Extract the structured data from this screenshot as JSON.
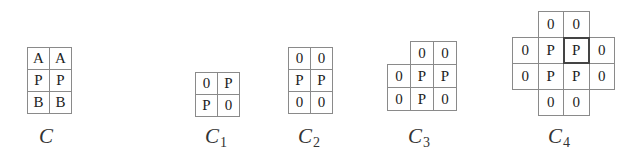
{
  "figures": [
    {
      "id": "C",
      "label": "C",
      "subscript": "",
      "origin": [
        27,
        47
      ],
      "cell_w": 22,
      "cell_h": 22,
      "label_pos": [
        39,
        124
      ],
      "cells": [
        {
          "r": 0,
          "c": 0,
          "v": "A"
        },
        {
          "r": 0,
          "c": 1,
          "v": "A"
        },
        {
          "r": 1,
          "c": 0,
          "v": "P"
        },
        {
          "r": 1,
          "c": 1,
          "v": "P"
        },
        {
          "r": 2,
          "c": 0,
          "v": "B"
        },
        {
          "r": 2,
          "c": 1,
          "v": "B"
        }
      ]
    },
    {
      "id": "C1",
      "label": "C",
      "subscript": "1",
      "origin": [
        195,
        72
      ],
      "cell_w": 22,
      "cell_h": 22,
      "label_pos": [
        205,
        124
      ],
      "cells": [
        {
          "r": 0,
          "c": 0,
          "v": "0"
        },
        {
          "r": 0,
          "c": 1,
          "v": "P"
        },
        {
          "r": 1,
          "c": 0,
          "v": "P"
        },
        {
          "r": 1,
          "c": 1,
          "v": "0"
        }
      ]
    },
    {
      "id": "C2",
      "label": "C",
      "subscript": "2",
      "origin": [
        288,
        47
      ],
      "cell_w": 22,
      "cell_h": 22,
      "label_pos": [
        298,
        124
      ],
      "cells": [
        {
          "r": 0,
          "c": 0,
          "v": "0"
        },
        {
          "r": 0,
          "c": 1,
          "v": "0"
        },
        {
          "r": 1,
          "c": 0,
          "v": "P"
        },
        {
          "r": 1,
          "c": 1,
          "v": "P"
        },
        {
          "r": 2,
          "c": 0,
          "v": "0"
        },
        {
          "r": 2,
          "c": 1,
          "v": "0"
        }
      ]
    },
    {
      "id": "C3",
      "label": "C",
      "subscript": "3",
      "origin": [
        387,
        41
      ],
      "cell_w": 23,
      "cell_h": 23,
      "label_pos": [
        408,
        124
      ],
      "cells": [
        {
          "r": 0,
          "c": 1,
          "v": "0"
        },
        {
          "r": 0,
          "c": 2,
          "v": "0"
        },
        {
          "r": 1,
          "c": 0,
          "v": "0"
        },
        {
          "r": 1,
          "c": 1,
          "v": "P"
        },
        {
          "r": 1,
          "c": 2,
          "v": "P"
        },
        {
          "r": 2,
          "c": 0,
          "v": "0"
        },
        {
          "r": 2,
          "c": 1,
          "v": "P"
        },
        {
          "r": 2,
          "c": 2,
          "v": "0"
        }
      ]
    },
    {
      "id": "C4",
      "label": "C",
      "subscript": "4",
      "origin": [
        512,
        11
      ],
      "cell_w": 25.5,
      "cell_h": 26,
      "label_pos": [
        548,
        124
      ],
      "cells": [
        {
          "r": 0,
          "c": 1,
          "v": "0"
        },
        {
          "r": 0,
          "c": 2,
          "v": "0"
        },
        {
          "r": 1,
          "c": 0,
          "v": "0"
        },
        {
          "r": 1,
          "c": 1,
          "v": "P"
        },
        {
          "r": 1,
          "c": 2,
          "v": "P",
          "bold": true
        },
        {
          "r": 1,
          "c": 3,
          "v": "0"
        },
        {
          "r": 2,
          "c": 0,
          "v": "0"
        },
        {
          "r": 2,
          "c": 1,
          "v": "P"
        },
        {
          "r": 2,
          "c": 2,
          "v": "P"
        },
        {
          "r": 2,
          "c": 3,
          "v": "0"
        },
        {
          "r": 3,
          "c": 1,
          "v": "0"
        },
        {
          "r": 3,
          "c": 2,
          "v": "0"
        }
      ]
    }
  ]
}
